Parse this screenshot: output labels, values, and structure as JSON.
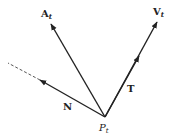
{
  "diagram": {
    "type": "vector-diagram",
    "colors": {
      "stroke": "#222222",
      "background": "#ffffff"
    },
    "origin": {
      "label": "P",
      "subscript": "t"
    },
    "vectors": [
      {
        "id": "A",
        "label": "A",
        "subscript": "t",
        "style": "bold"
      },
      {
        "id": "V",
        "label": "V",
        "subscript": "t",
        "style": "bold"
      },
      {
        "id": "N",
        "label": "N",
        "style": "bold",
        "extension": "dashed"
      },
      {
        "id": "T",
        "label": "T",
        "style": "bold"
      }
    ]
  }
}
